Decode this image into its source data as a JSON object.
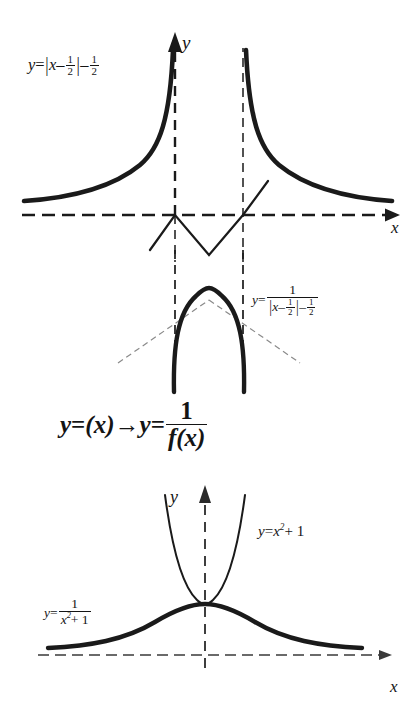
{
  "page": {
    "width": 409,
    "height": 713,
    "background_color": "#ffffff",
    "ink_color": "#141414"
  },
  "panels": {
    "top": {
      "name": "absolute-value-function-graph",
      "curve_label": "y = |x - 1/2| - 1/2",
      "axis_x_label": "x",
      "axis_y_label": "y",
      "description": "Graph of y = |x-1/2|-1/2 shown as a V line together with the reciprocal branches rising toward two vertical asymptotes"
    },
    "middle": {
      "name": "reciprocal-of-absolute-value-graph",
      "curve_label": "y = 1/(|x - 1/2| - 1/2)",
      "description": "Arch shaped branch of the reciprocal function bounded by two vertical dashed asymptotes"
    },
    "center_statement": {
      "name": "transformation-statement",
      "text": "y = (x) → y = 1/f(x)"
    },
    "bottom": {
      "name": "parabola-and-reciprocal-graph",
      "parabola_label": "y = x² + 1",
      "reciprocal_label": "y = 1/(x² + 1)",
      "axis_x_label": "x",
      "axis_y_label": "y",
      "description": "Parabola y = x squared plus one together with its reciprocal bell shaped curve touching at the common vertex"
    }
  },
  "labels": {
    "abs": {
      "y": "y",
      "equals": "=",
      "x": "x",
      "minus": "–",
      "half_num": "1",
      "half_den": "2",
      "minus2": "–",
      "half2_num": "1",
      "half2_den": "2"
    },
    "recip_abs": {
      "y": "y",
      "equals": "=",
      "numerator": "1",
      "x": "x",
      "minus": "–",
      "half_num": "1",
      "half_den": "2",
      "minus2": "–",
      "half2_num": "1",
      "half2_den": "2"
    },
    "transform": {
      "y1": "y",
      "equals1": "=",
      "fx1": "(x)",
      "arrow": "→",
      "y2": "y",
      "equals2": "=",
      "numerator": "1",
      "denominator": "f(x)"
    },
    "parabola": {
      "y": "y",
      "equals": "=",
      "x": "x",
      "exponent": "2",
      "plus_one": "+ 1"
    },
    "recip_parabola": {
      "y": "y",
      "equals": "=",
      "numerator": "1",
      "x": "x",
      "exponent": "2",
      "plus_one": "+ 1"
    }
  },
  "axes": {
    "top_y": "y",
    "top_x": "x",
    "bottom_y": "y",
    "bottom_x": "x"
  }
}
